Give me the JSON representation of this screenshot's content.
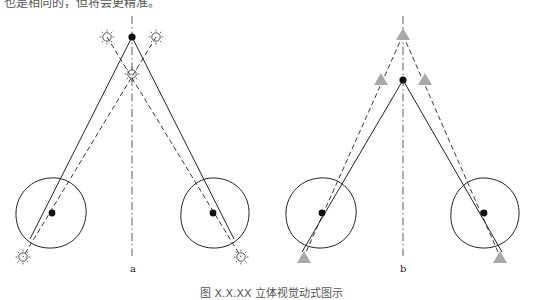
{
  "top_text": "也是相同的，但将会更精准。",
  "caption": "图 X.X.XX   立体视觉动式图示",
  "panels": [
    {
      "label": "a",
      "marker_type": "sun-icon",
      "center_x": 132,
      "target_point": [
        132,
        37
      ],
      "upper_markers": [
        [
          107,
          37
        ],
        [
          156,
          37
        ]
      ],
      "middle_marker": [
        132,
        74
      ],
      "eyes": [
        {
          "center": [
            50,
            213
          ],
          "pupil": [
            52,
            213
          ],
          "marker": [
            23,
            257
          ]
        },
        {
          "center": [
            215,
            213
          ],
          "pupil": [
            213,
            213
          ],
          "marker": [
            241,
            257
          ]
        }
      ]
    },
    {
      "label": "b",
      "marker_type": "triangle-icon",
      "center_x": 403,
      "target_point": [
        403,
        80
      ],
      "top_marker": [
        403,
        35
      ],
      "upper_markers": [
        [
          381,
          80
        ],
        [
          425,
          80
        ]
      ],
      "eyes": [
        {
          "center": [
            320,
            213
          ],
          "pupil": [
            322,
            213
          ],
          "marker": [
            304,
            258
          ]
        },
        {
          "center": [
            485,
            213
          ],
          "pupil": [
            484,
            213
          ],
          "marker": [
            500,
            258
          ]
        }
      ]
    }
  ],
  "colors": {
    "line": "#222222",
    "triangle_fill": "#a8a8a8",
    "sun_stroke": "#555555"
  }
}
